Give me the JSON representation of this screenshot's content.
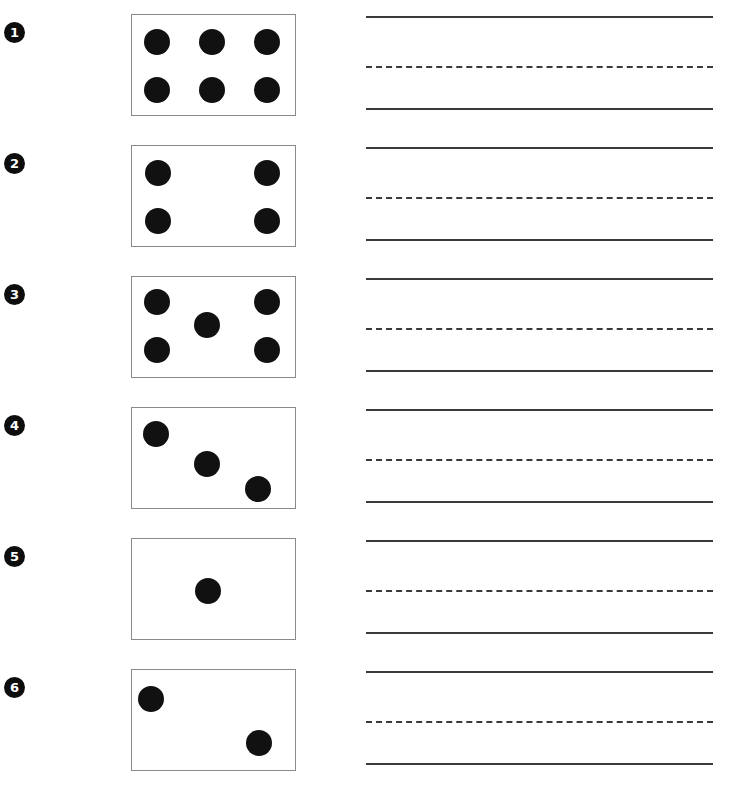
{
  "worksheet": {
    "title": "Dot Pattern Counting Worksheet",
    "page_width": 729,
    "page_height": 794,
    "background_color": "#ffffff",
    "dot_color": "#111111",
    "card_border_color": "#8a8a8a",
    "rule_color": "#3a3a3a",
    "bullet_color": "#0d0d0d",
    "bullet_text_color": "#ffffff",
    "card": {
      "left": 131,
      "width": 163,
      "height": 100,
      "dot_diameter": 26
    },
    "lines": {
      "left": 366,
      "width": 347,
      "top_offset": 16,
      "mid_offset": 66,
      "base_offset": 108
    },
    "row_pitch": 131,
    "rows": [
      {
        "number": "1",
        "top": 0,
        "dot_count": 6,
        "pattern": "six-rectangular-grid",
        "dots": [
          {
            "x": 12,
            "y": 14
          },
          {
            "x": 67,
            "y": 14
          },
          {
            "x": 122,
            "y": 14
          },
          {
            "x": 12,
            "y": 62
          },
          {
            "x": 67,
            "y": 62
          },
          {
            "x": 122,
            "y": 62
          }
        ]
      },
      {
        "number": "2",
        "top": 131,
        "dot_count": 4,
        "pattern": "four-corners",
        "dots": [
          {
            "x": 13,
            "y": 14
          },
          {
            "x": 122,
            "y": 14
          },
          {
            "x": 13,
            "y": 62
          },
          {
            "x": 122,
            "y": 62
          }
        ]
      },
      {
        "number": "3",
        "top": 262,
        "dot_count": 5,
        "pattern": "five-quincunx",
        "dots": [
          {
            "x": 12,
            "y": 12
          },
          {
            "x": 122,
            "y": 12
          },
          {
            "x": 62,
            "y": 35
          },
          {
            "x": 12,
            "y": 60
          },
          {
            "x": 122,
            "y": 60
          }
        ]
      },
      {
        "number": "4",
        "top": 393,
        "dot_count": 3,
        "pattern": "three-diagonal",
        "dots": [
          {
            "x": 11,
            "y": 13
          },
          {
            "x": 62,
            "y": 43
          },
          {
            "x": 113,
            "y": 68
          }
        ]
      },
      {
        "number": "5",
        "top": 524,
        "dot_count": 1,
        "pattern": "one-center",
        "dots": [
          {
            "x": 63,
            "y": 39
          }
        ]
      },
      {
        "number": "6",
        "top": 655,
        "dot_count": 2,
        "pattern": "two-diagonal",
        "dots": [
          {
            "x": 6,
            "y": 16
          },
          {
            "x": 114,
            "y": 60
          }
        ]
      }
    ]
  }
}
